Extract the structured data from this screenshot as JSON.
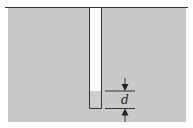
{
  "diagram": {
    "dimension_label": "d",
    "colors": {
      "liquid": "#c9c9c9",
      "background": "#ffffff",
      "line": "#333333",
      "tube_interior": "#ffffff"
    }
  }
}
